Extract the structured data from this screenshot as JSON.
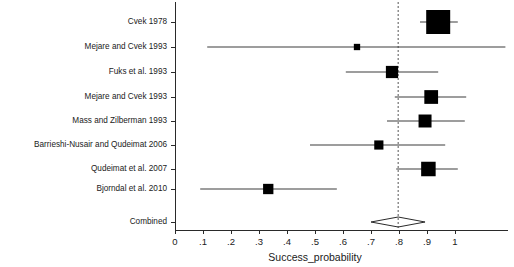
{
  "chart_data": {
    "type": "forest",
    "title": "",
    "xlabel": "Success_probability",
    "ylabel": "",
    "xlim": [
      0,
      1
    ],
    "grid": false,
    "legend": "none",
    "reference_line": 0.797,
    "x_ticks": [
      0,
      0.1,
      0.2,
      0.3,
      0.4,
      0.5,
      0.6,
      0.7,
      0.8,
      0.9,
      1
    ],
    "x_tick_labels": [
      "0",
      ".1",
      ".2",
      ".3",
      ".4",
      ".5",
      ".6",
      ".7",
      ".8",
      ".9",
      "1"
    ],
    "studies": [
      {
        "label": "Cvek 1978",
        "estimate": 0.94,
        "ci_low": 0.875,
        "ci_high": 1.01,
        "weight": 1.0
      },
      {
        "label": "Mejare and Cvek 1993",
        "estimate": 0.65,
        "ci_low": 0.115,
        "ci_high": 1.18,
        "weight": 0.07
      },
      {
        "label": "Fuks et al. 1993",
        "estimate": 0.775,
        "ci_low": 0.61,
        "ci_high": 0.94,
        "weight": 0.38
      },
      {
        "label": "Mejare and Cvek 1993",
        "estimate": 0.915,
        "ci_low": 0.785,
        "ci_high": 1.04,
        "weight": 0.46
      },
      {
        "label": "Mass and Zilberman 1993",
        "estimate": 0.893,
        "ci_low": 0.757,
        "ci_high": 1.035,
        "weight": 0.42
      },
      {
        "label": "Barrieshi-Nusair and Qudeimat 2006",
        "estimate": 0.728,
        "ci_low": 0.482,
        "ci_high": 0.965,
        "weight": 0.22
      },
      {
        "label": "Qudeimat et al. 2007",
        "estimate": 0.905,
        "ci_low": 0.79,
        "ci_high": 1.01,
        "weight": 0.5
      },
      {
        "label": "Bjorndal et al. 2010",
        "estimate": 0.333,
        "ci_low": 0.09,
        "ci_high": 0.578,
        "weight": 0.28
      }
    ],
    "combined": {
      "label": "Combined",
      "estimate": 0.797,
      "ci_low": 0.7,
      "ci_high": 0.893
    }
  }
}
